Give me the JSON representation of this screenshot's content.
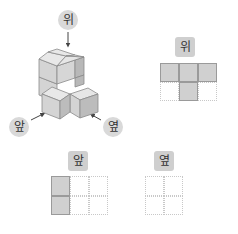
{
  "labels": {
    "top_circle": "위",
    "front_circle": "앞",
    "side_circle": "옆",
    "top_view": "위",
    "front_view": "앞",
    "side_view": "옆"
  },
  "views": {
    "top": {
      "rows": 2,
      "cols": 3,
      "filled": [
        [
          1,
          1,
          1
        ],
        [
          0,
          1,
          0
        ]
      ]
    },
    "front": {
      "rows": 2,
      "cols": 3,
      "filled": [
        [
          1,
          0,
          0
        ],
        [
          1,
          0,
          0
        ]
      ]
    },
    "side": {
      "rows": 2,
      "cols": 2,
      "filled": [
        [
          0,
          0
        ],
        [
          0,
          0
        ]
      ]
    }
  },
  "colors": {
    "cube_top": "#e6e6e6",
    "cube_front": "#d4d4d4",
    "cube_side": "#b8b8b8",
    "filled_cell": "#d0d0d0",
    "label_bg": "#d9d9d9"
  }
}
